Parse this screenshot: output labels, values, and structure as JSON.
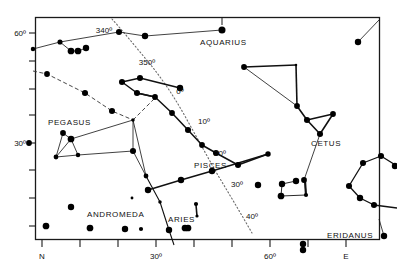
{
  "figure": {
    "frame_color": "#1a1a1a",
    "star_color": "#000000",
    "line_color": "#111111",
    "ecliptic_color": "#666666"
  },
  "axes": {
    "x_axis": {
      "label_left": "N",
      "label_right": "E",
      "ticks": [
        {
          "value": "",
          "x": 59
        },
        {
          "value": "",
          "x": 96
        },
        {
          "value": "30º",
          "x": 133
        },
        {
          "value": "",
          "x": 170
        },
        {
          "value": "",
          "x": 207
        },
        {
          "value": "60º",
          "x": 244
        },
        {
          "value": "",
          "x": 281
        },
        {
          "value": "",
          "x": 318
        },
        {
          "value": "",
          "x": 355
        }
      ],
      "tick_labels": [
        "N",
        "30º",
        "60º",
        "E"
      ]
    },
    "y_axis": {
      "ticks": [
        {
          "value": "60º",
          "y": 33
        },
        {
          "value": "",
          "y": 65
        },
        {
          "value": "",
          "y": 97
        },
        {
          "value": "30º",
          "y": 143
        },
        {
          "value": "",
          "y": 175
        },
        {
          "value": "",
          "y": 207
        }
      ],
      "tick_labels": [
        "60º",
        "30º"
      ]
    }
  },
  "ecliptic": {
    "name": "ecliptic",
    "style": "dotted",
    "labels": [
      {
        "text": "340º",
        "x": 104,
        "y": 30
      },
      {
        "text": "350º",
        "x": 147,
        "y": 62
      },
      {
        "text": "0º",
        "x": 181,
        "y": 91
      },
      {
        "text": "10º",
        "x": 205,
        "y": 121
      },
      {
        "text": "20º",
        "x": 221,
        "y": 152
      },
      {
        "text": "30º",
        "x": 238,
        "y": 183
      },
      {
        "text": "40º",
        "x": 252,
        "y": 215
      }
    ]
  },
  "constellations": [
    {
      "name": "AQUARIUS",
      "label_x": 200,
      "label_y": 42
    },
    {
      "name": "PEGASUS",
      "label_x": 48,
      "label_y": 122
    },
    {
      "name": "ANDROMEDA",
      "label_x": 87,
      "label_y": 214
    },
    {
      "name": "PISCES",
      "label_x": 194,
      "label_y": 165
    },
    {
      "name": "ARIES",
      "label_x": 198,
      "label_y": 220
    },
    {
      "name": "CETUS",
      "label_x": 311,
      "label_y": 143
    },
    {
      "name": "ERIDANUS",
      "label_x": 351,
      "label_y": 238
    }
  ],
  "chart_data": {
    "type": "scatter",
    "xlabel": "Azimuth",
    "ylabel": "Altitude",
    "xlim": [
      0,
      90
    ],
    "ylim": [
      0,
      65
    ],
    "grid": false,
    "legend": "none",
    "stars": [
      {
        "x": 33,
        "y": 49,
        "mag": 3.4
      },
      {
        "x": 60,
        "y": 42,
        "mag": 3.0
      },
      {
        "x": 71,
        "y": 51,
        "mag": 2.0
      },
      {
        "x": 78,
        "y": 51,
        "mag": 2.0
      },
      {
        "x": 86,
        "y": 48,
        "mag": 2.2
      },
      {
        "x": 119,
        "y": 32,
        "mag": 2.4
      },
      {
        "x": 145,
        "y": 36,
        "mag": 2.2
      },
      {
        "x": 222,
        "y": 30,
        "mag": 1.8
      },
      {
        "x": 47,
        "y": 74,
        "mag": 2.6
      },
      {
        "x": 85,
        "y": 93,
        "mag": 2.4
      },
      {
        "x": 112,
        "y": 111,
        "mag": 2.4
      },
      {
        "x": 133,
        "y": 120,
        "mag": 4.0
      },
      {
        "x": 29,
        "y": 143,
        "mag": 2.6
      },
      {
        "x": 63,
        "y": 133,
        "mag": 2.6
      },
      {
        "x": 71,
        "y": 139,
        "mag": 2.0
      },
      {
        "x": 56,
        "y": 157,
        "mag": 3.2
      },
      {
        "x": 78,
        "y": 155,
        "mag": 3.4
      },
      {
        "x": 133,
        "y": 151,
        "mag": 2.4
      },
      {
        "x": 132,
        "y": 198,
        "mag": 4.4
      },
      {
        "x": 146,
        "y": 176,
        "mag": 3.2
      },
      {
        "x": 160,
        "y": 202,
        "mag": 4.0
      },
      {
        "x": 71,
        "y": 207,
        "mag": 2.2
      },
      {
        "x": 46,
        "y": 226,
        "mag": 2.0
      },
      {
        "x": 90,
        "y": 228,
        "mag": 2.0
      },
      {
        "x": 125,
        "y": 229,
        "mag": 2.2
      },
      {
        "x": 141,
        "y": 229,
        "mag": 3.6
      },
      {
        "x": 188,
        "y": 228,
        "mag": 2.0
      },
      {
        "x": 122,
        "y": 82,
        "mag": 2.4
      },
      {
        "x": 140,
        "y": 78,
        "mag": 2.4
      },
      {
        "x": 180,
        "y": 88,
        "mag": 2.2
      },
      {
        "x": 137,
        "y": 93,
        "mag": 2.4
      },
      {
        "x": 155,
        "y": 97,
        "mag": 2.6
      },
      {
        "x": 172,
        "y": 113,
        "mag": 2.6
      },
      {
        "x": 188,
        "y": 130,
        "mag": 2.4
      },
      {
        "x": 202,
        "y": 145,
        "mag": 2.6
      },
      {
        "x": 216,
        "y": 153,
        "mag": 2.4
      },
      {
        "x": 238,
        "y": 165,
        "mag": 2.4
      },
      {
        "x": 268,
        "y": 154,
        "mag": 2.8
      },
      {
        "x": 212,
        "y": 171,
        "mag": 2.2
      },
      {
        "x": 181,
        "y": 180,
        "mag": 2.2
      },
      {
        "x": 148,
        "y": 190,
        "mag": 2.2
      },
      {
        "x": 196,
        "y": 204,
        "mag": 3.6
      },
      {
        "x": 197,
        "y": 216,
        "mag": 4.2
      },
      {
        "x": 185,
        "y": 228,
        "mag": 2.0
      },
      {
        "x": 244,
        "y": 67,
        "mag": 2.6
      },
      {
        "x": 296,
        "y": 65,
        "mag": 4.6
      },
      {
        "x": 297,
        "y": 106,
        "mag": 2.6
      },
      {
        "x": 307,
        "y": 120,
        "mag": 2.4
      },
      {
        "x": 333,
        "y": 114,
        "mag": 2.6
      },
      {
        "x": 320,
        "y": 134,
        "mag": 2.4
      },
      {
        "x": 304,
        "y": 180,
        "mag": 2.6
      },
      {
        "x": 306,
        "y": 195,
        "mag": 3.6
      },
      {
        "x": 296,
        "y": 181,
        "mag": 2.2
      },
      {
        "x": 282,
        "y": 184,
        "mag": 2.2
      },
      {
        "x": 281,
        "y": 196,
        "mag": 2.0
      },
      {
        "x": 349,
        "y": 186,
        "mag": 2.4
      },
      {
        "x": 363,
        "y": 163,
        "mag": 2.4
      },
      {
        "x": 381,
        "y": 156,
        "mag": 2.4
      },
      {
        "x": 395,
        "y": 166,
        "mag": 2.2
      },
      {
        "x": 374,
        "y": 205,
        "mag": 2.4
      },
      {
        "x": 360,
        "y": 198,
        "mag": 2.2
      },
      {
        "x": 384,
        "y": 236,
        "mag": 2.2
      },
      {
        "x": 358,
        "y": 42,
        "mag": 2.2
      },
      {
        "x": 303,
        "y": 244,
        "mag": 2.2
      },
      {
        "x": 303,
        "y": 250,
        "mag": 2.2
      },
      {
        "x": 258,
        "y": 185,
        "mag": 2.2
      },
      {
        "x": 169,
        "y": 230,
        "mag": 2.2
      }
    ]
  }
}
